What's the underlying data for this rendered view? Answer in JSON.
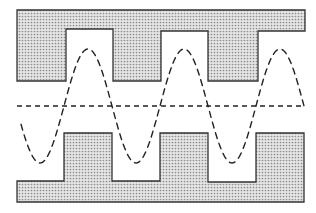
{
  "diagram": {
    "type": "interdigitated-electrode-waveguide",
    "colors": {
      "background": "#ffffff",
      "fill_base": "#e6e6e6",
      "fill_dot": "#8a8a8a",
      "stroke": "#333333",
      "dash": "#222222"
    },
    "top_electrode": {
      "label": "",
      "outline": [
        [
          17,
          10
        ],
        [
          305,
          10
        ],
        [
          305,
          31
        ],
        [
          258,
          31
        ],
        [
          258,
          81
        ],
        [
          208,
          81
        ],
        [
          208,
          31
        ],
        [
          161,
          31
        ],
        [
          161,
          81
        ],
        [
          113,
          81
        ],
        [
          113,
          29
        ],
        [
          66,
          29
        ],
        [
          66,
          81
        ],
        [
          17,
          81
        ]
      ]
    },
    "bottom_electrode": {
      "label": "",
      "outline": [
        [
          17,
          181
        ],
        [
          64,
          181
        ],
        [
          64,
          133
        ],
        [
          112,
          133
        ],
        [
          112,
          181
        ],
        [
          160,
          181
        ],
        [
          160,
          133
        ],
        [
          208,
          133
        ],
        [
          208,
          182
        ],
        [
          256,
          182
        ],
        [
          256,
          133
        ],
        [
          304,
          133
        ],
        [
          304,
          202
        ],
        [
          17,
          202
        ]
      ]
    },
    "centerline": {
      "y": 106,
      "x_start": 17,
      "x_end": 304,
      "style": "dashed"
    },
    "wave": {
      "style": "dashed",
      "center_y": 106,
      "amplitude": 57,
      "period": 96,
      "x_start": 21,
      "x_end": 305,
      "peaks_x": [
        88,
        183,
        283
      ],
      "troughs_x": [
        39,
        133,
        233
      ]
    }
  }
}
